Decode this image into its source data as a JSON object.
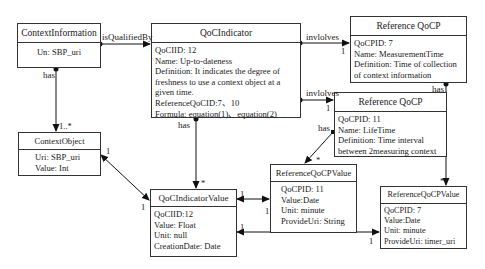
{
  "classes": {
    "context_information": {
      "name": "ContextInformation",
      "attributes": [
        "Un: SBP_uri"
      ]
    },
    "qoc_indicator": {
      "name": "QoCIndicator",
      "attributes": [
        "QoCIID: 12",
        "Name: Up-to-dateness",
        "Definition: It indicates the degree of freshness to use a context object at a given time.",
        "ReferenceQoCID:7、10",
        "Formula: equation(1)、equation(2)"
      ]
    },
    "reference_qocp_7": {
      "name": "Reference QoCP",
      "attributes": [
        "QoCPID: 7",
        "Name: MeasurementTime",
        "Definition: Time of collection of context information"
      ]
    },
    "reference_qocp_11": {
      "name": "Reference QoCP",
      "attributes": [
        "QoCPID: 11",
        "Name: LifeTime",
        "Definition: Time interval between 2measuring context"
      ]
    },
    "context_object": {
      "name": "ContextObject",
      "attributes": [
        "Uri: SBP_uri",
        "Value: Int"
      ]
    },
    "qoc_indicator_value": {
      "name": "QoCIndicatorValue",
      "attributes": [
        "QoCIID:12",
        "Value: Float",
        "Unit: null",
        "CreationDate: Date"
      ]
    },
    "reference_qocp_value_11": {
      "name": "ReferenceQoCPValue",
      "attributes": [
        "QoCPID: 11",
        "Value:Date",
        "Unit: minute",
        "ProvideUri: String"
      ]
    },
    "reference_qocp_value_7": {
      "name": "ReferenceQoCPValue",
      "attributes": [
        "QoCPID: 7",
        "Value:Date",
        "Unit: minute",
        "ProvideUri: timer_uri"
      ]
    }
  },
  "relations": {
    "is_qualified_by": "isQualifiedBy",
    "involves_1": "invlolves",
    "involves_2": "invlolves",
    "has_ci": "has",
    "has_qoci": "has",
    "has_qocp7": "has",
    "has_qocp11": "has"
  },
  "multiplicities": {
    "ci_co": "1..*",
    "qoci_qociv": "*",
    "involves1_target": "1",
    "involves2_target": "1",
    "qocp11_value": "*",
    "qocp7_value": "*",
    "co_qociv_a": "1",
    "co_qociv_b": "1",
    "qociv_rv11_a": "1",
    "qociv_rv11_b": "1",
    "qociv_rv7_a": "1",
    "qociv_rv7_b": "1"
  }
}
